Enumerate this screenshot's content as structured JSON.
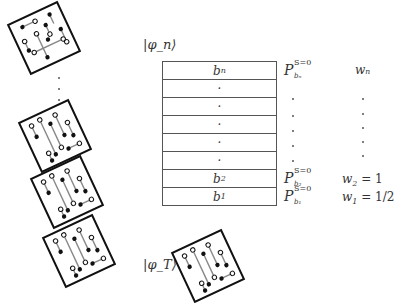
{
  "labels": {
    "ket_n": "|φ_n⟩",
    "ket_T": "|φ_T⟩"
  },
  "stack": {
    "rows": [
      {
        "label": "b",
        "sub": "n",
        "projector": {
          "symbol": "P",
          "sup": "S=0",
          "sub": "b_n"
        },
        "weight": "w_n"
      },
      {
        "label": "·",
        "sub": "",
        "projector": null,
        "weight": "·"
      },
      {
        "label": "·",
        "sub": "",
        "projector": null,
        "weight": "·"
      },
      {
        "label": "·",
        "sub": "",
        "projector": null,
        "weight": "·"
      },
      {
        "label": "·",
        "sub": "",
        "projector": null,
        "weight": "·"
      },
      {
        "label": "·",
        "sub": "",
        "projector": null,
        "weight": "·"
      },
      {
        "label": "b",
        "sub": "2",
        "projector": {
          "symbol": "P",
          "sup": "S=0",
          "sub": "b_2"
        },
        "weight": "w_2 = 1"
      },
      {
        "label": "b",
        "sub": "1",
        "projector": {
          "symbol": "P",
          "sup": "S=0",
          "sub": "b_1"
        },
        "weight": "w_1 = 1/2"
      }
    ]
  },
  "projectors": {
    "top": {
      "symbol": "P",
      "sup": "S=0",
      "sub": "bₙ"
    },
    "b2": {
      "symbol": "P",
      "sup": "S=0",
      "sub": "b₂"
    },
    "b1": {
      "symbol": "P",
      "sup": "S=0",
      "sub": "b₁"
    }
  },
  "weights": {
    "top": "wₙ",
    "w2_name": "w",
    "w2_sub": "2",
    "w2_val": " = 1",
    "w1_name": "w",
    "w1_sub": "1",
    "w1_val": " = 1/2"
  },
  "rows_text": {
    "bn": "b",
    "bn_sub": "n",
    "dot": "·",
    "b2": "b",
    "b2_sub": "2",
    "b1": "b",
    "b1_sub": "1"
  },
  "configurations": [
    {
      "id": "config-n",
      "rotation": -25
    },
    {
      "id": "config-3",
      "rotation": -25
    },
    {
      "id": "config-2",
      "rotation": -25
    },
    {
      "id": "config-1",
      "rotation": -25
    },
    {
      "id": "config-T",
      "rotation": -25
    }
  ],
  "colors": {
    "line": "#555555",
    "frame": "#111111",
    "bond": "#888888"
  }
}
